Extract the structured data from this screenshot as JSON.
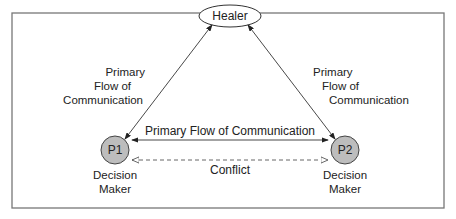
{
  "diagram": {
    "healer": {
      "label": "Healer"
    },
    "p1": {
      "label": "P1",
      "role_line1": "Decision",
      "role_line2": "Maker",
      "fill": "#bdbdbd"
    },
    "p2": {
      "label": "P2",
      "role_line1": "Decision",
      "role_line2": "Maker",
      "fill": "#bdbdbd"
    },
    "left_edge": {
      "line1": "Primary",
      "line2": "Flow of",
      "line3": "Communication"
    },
    "right_edge": {
      "line1": "Primary",
      "line2": "Flow of",
      "line3": "Communication"
    },
    "middle_edge": {
      "label": "Primary Flow of Communication"
    },
    "conflict_edge": {
      "label": "Conflict"
    },
    "colors": {
      "stroke": "#333333",
      "border": "#666666"
    }
  }
}
